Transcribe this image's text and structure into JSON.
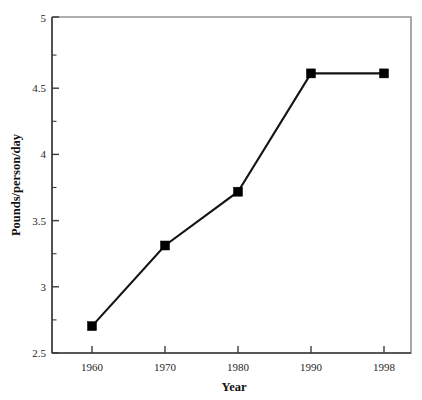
{
  "chart_data": {
    "type": "line",
    "title": "",
    "xlabel": "Year",
    "ylabel": "Pounds/person/day",
    "categories": [
      "1960",
      "1970",
      "1980",
      "1990",
      "1998"
    ],
    "x": [
      1960,
      1970,
      1980,
      1990,
      1998
    ],
    "values": [
      2.7,
      3.3,
      3.7,
      4.58,
      4.58
    ],
    "series": [
      {
        "name": "Pounds/person/day",
        "values": [
          2.7,
          3.3,
          3.7,
          4.58,
          4.58
        ]
      }
    ],
    "ylim": [
      2.5,
      5
    ],
    "xlim": [
      "1960",
      "1998"
    ],
    "y_major_ticks": [
      "2.5",
      "3",
      "3.5",
      "4",
      "4.5",
      "5"
    ],
    "y_major_tick_values": [
      2.5,
      3,
      3.5,
      4,
      4.5,
      5
    ],
    "y_minor_tick_values": [
      2.75,
      3.25,
      3.75,
      4.25,
      4.75
    ],
    "x_tick_labels": [
      "1960",
      "1970",
      "1980",
      "1990",
      "1998"
    ],
    "grid": false,
    "legend": false,
    "legend_position": "none",
    "marker": "filled-square",
    "line_color": "#141414",
    "marker_color": "#000000",
    "background_color": "#ffffff",
    "axis_color": "#3b3b3b"
  },
  "axis": {
    "y_title": "Pounds/person/day",
    "x_title": "Year",
    "y_labels": {
      "t0": "2.5",
      "t1": "3",
      "t2": "3.5",
      "t3": "4",
      "t4": "4.5",
      "t5": "5"
    },
    "x_labels": {
      "t0": "1960",
      "t1": "1970",
      "t2": "1980",
      "t3": "1990",
      "t4": "1998"
    }
  }
}
